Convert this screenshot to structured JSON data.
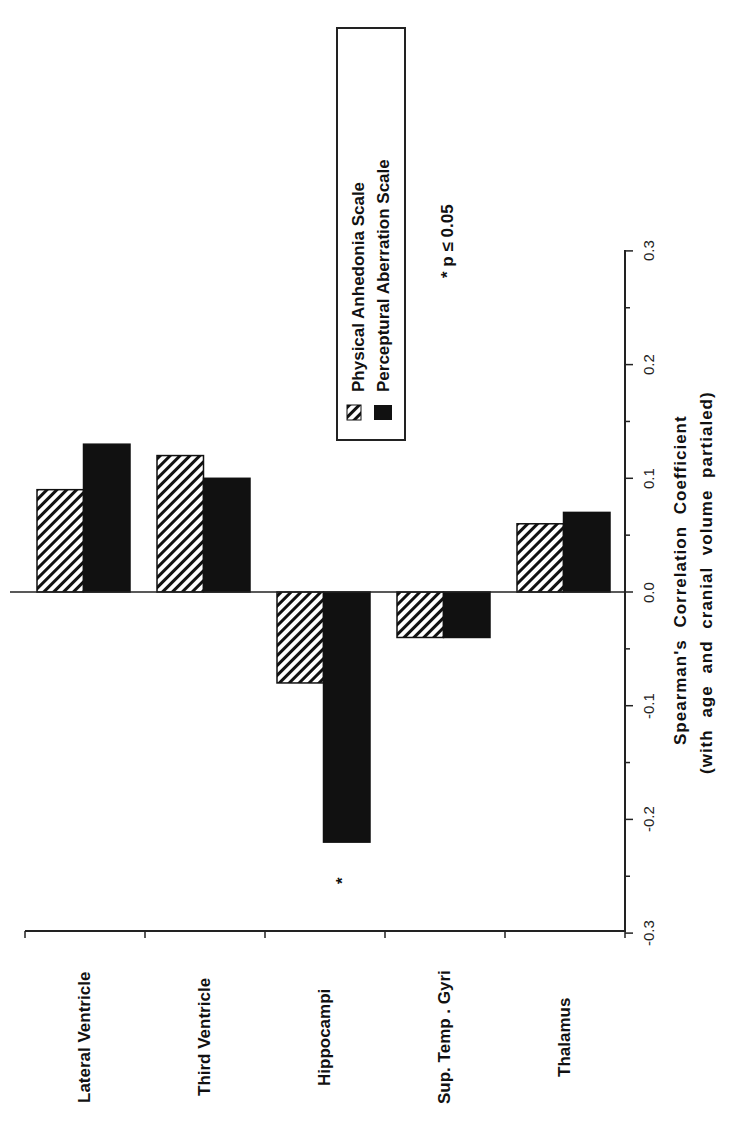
{
  "chart_data": {
    "type": "bar",
    "orientation": "rotated -90deg (page rotated counterclockwise); bars extend from a zero line",
    "categories": [
      "Lateral Ventricle",
      "Third Ventricle",
      "Hippocampi",
      "Sup. Temp . Gyri",
      "Thalamus"
    ],
    "series": [
      {
        "name": "Physical Anhedonia Scale",
        "pattern": "hatched",
        "values": [
          0.09,
          0.12,
          -0.08,
          -0.04,
          0.06
        ]
      },
      {
        "name": "Perceptural Aberration Scale",
        "pattern": "solid-black",
        "values": [
          0.13,
          0.1,
          -0.22,
          -0.04,
          0.07
        ]
      }
    ],
    "title": "",
    "xlabel": "",
    "ylabel": "Spearman's Correlation Coefficient",
    "ylabel_sub": "(with age and cranial volume partialed)",
    "ylim": [
      -0.3,
      0.3
    ],
    "yticks": [
      "-0.3",
      "-0.2",
      "-0.1",
      "0.0",
      "0.1",
      "0.2",
      "0.3"
    ],
    "grid": false,
    "legend_position": "upper (top of rotated page, right side of plot)",
    "annotations": [
      {
        "text": "*",
        "category": "Hippocampi",
        "series": "Perceptural Aberration Scale"
      },
      {
        "text": "* p ≤ 0.05"
      }
    ]
  },
  "legend": {
    "items": [
      "Physical Anhedonia Scale",
      "Perceptural Aberration Scale"
    ]
  },
  "axis": {
    "title_line1": "Spearman's  Correlation  Coefficient",
    "title_line2": "(with  age  and  cranial  volume  partialed)",
    "ticks": [
      "-0.3",
      "-0.2",
      "-0.1",
      "0.0",
      "0.1",
      "0.2",
      "0.3"
    ]
  },
  "categories": [
    "Lateral Ventricle",
    "Third Ventricle",
    "Hippocampi",
    "Sup. Temp . Gyri",
    "Thalamus"
  ],
  "significance_marker": "*",
  "significance_note": "*  p  ≤  0.05",
  "colors": {
    "bar_solid": "#111111",
    "hatch": "#111111",
    "axis": "#222222",
    "background": "#ffffff"
  }
}
